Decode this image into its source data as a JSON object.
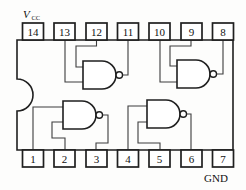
{
  "diagram": {
    "type": "ic-pinout",
    "device": "quad-2-input-NAND",
    "package": "DIP-14",
    "labels": {
      "vcc": "V",
      "vcc_sub": "CC",
      "gnd": "GND"
    },
    "pins": {
      "top": [
        "14",
        "13",
        "12",
        "11",
        "10",
        "9",
        "8"
      ],
      "bottom": [
        "1",
        "2",
        "3",
        "4",
        "5",
        "6",
        "7"
      ]
    },
    "gates": [
      {
        "name": "top-left-nand",
        "inputs": [
          "12",
          "13"
        ],
        "output": "11"
      },
      {
        "name": "top-right-nand",
        "inputs": [
          "9",
          "10"
        ],
        "output": "8"
      },
      {
        "name": "bottom-left-nand",
        "inputs": [
          "1",
          "2"
        ],
        "output": "3"
      },
      {
        "name": "bottom-right-nand",
        "inputs": [
          "4",
          "5"
        ],
        "output": "6"
      }
    ],
    "colors": {
      "line": "#1f1f1f",
      "wire": "#3d3d3d",
      "text": "#111111",
      "background": "#fdfdfc"
    }
  }
}
